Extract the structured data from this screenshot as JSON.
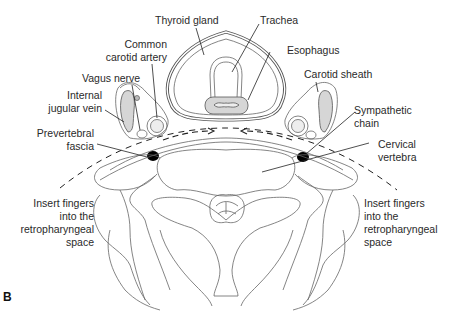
{
  "figure": {
    "panel_label": "B",
    "labels": {
      "thyroid_gland": "Thyroid gland",
      "trachea": "Trachea",
      "common_carotid_line1": "Common",
      "common_carotid_line2": "carotid artery",
      "esophagus": "Esophagus",
      "vagus_nerve": "Vagus nerve",
      "carotid_sheath": "Carotid sheath",
      "internal_jugular_line1": "Internal",
      "internal_jugular_line2": "jugular vein",
      "sympathetic_line1": "Sympathetic",
      "sympathetic_line2": "chain",
      "prevertebral_line1": "Prevertebral",
      "prevertebral_line2": "fascia",
      "cervical_line1": "Cervical",
      "cervical_line2": "vertebra",
      "insert_left": [
        "Insert fingers",
        "into the",
        "retropharyngeal",
        "space"
      ],
      "insert_right": [
        "Insert fingers",
        "into the",
        "retropharyngeal",
        "space"
      ]
    },
    "colors": {
      "line": "#555555",
      "shade": "#d6d6d6",
      "text": "#2a2a2a",
      "fill_black": "#000000"
    }
  }
}
